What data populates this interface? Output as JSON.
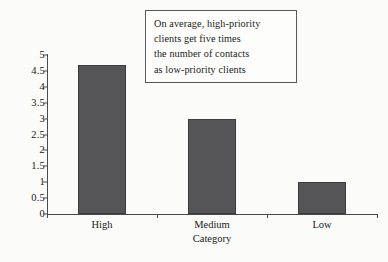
{
  "chart_data": {
    "type": "bar",
    "title": "",
    "subtitle": "",
    "xlabel": "Category",
    "ylabel": "",
    "categories": [
      "High",
      "Medium",
      "Low"
    ],
    "values": [
      4.7,
      3,
      1
    ],
    "series": [
      {
        "name": "Average number of contacts",
        "values": [
          4.7,
          3,
          1
        ]
      }
    ],
    "ylim": [
      0,
      5
    ],
    "yticks": [
      "0",
      "0.5",
      "1",
      "1.5",
      "2",
      "2.5",
      "3",
      "3.5",
      "4",
      "4.5",
      "5"
    ],
    "ytick_values": [
      0,
      0.5,
      1,
      1.5,
      2,
      2.5,
      3,
      3.5,
      4,
      4.5,
      5
    ],
    "grid": false,
    "legend": false,
    "legend_position": "none",
    "bar_color": "#555558",
    "bar_border_color": "#3c3c3f",
    "background_color": "#fbfbf9",
    "axis_color": "#4a4a4a",
    "annotations": [
      {
        "name": "callout-box",
        "lines": [
          "On average, high-priority",
          "clients get five times",
          "the number of contacts",
          "as low-priority clients"
        ],
        "border_color": "#585858"
      }
    ]
  }
}
